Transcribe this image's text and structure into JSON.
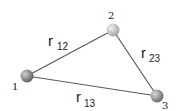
{
  "diagram": {
    "title": "",
    "nodes": [
      {
        "id": "1",
        "label": "1",
        "x": 27,
        "y": 76,
        "color": "#7a7a7a",
        "label_x": 12,
        "label_y": 89
      },
      {
        "id": "2",
        "label": "2",
        "x": 113,
        "y": 30,
        "color": "#b8b8b8",
        "label_x": 109,
        "label_y": 18
      },
      {
        "id": "3",
        "label": "3",
        "x": 157,
        "y": 96,
        "color": "#8a8a8a",
        "label_x": 162,
        "label_y": 109
      }
    ],
    "edges": [
      {
        "from": "1",
        "to": "2",
        "label": "r",
        "subscript": "12"
      },
      {
        "from": "2",
        "to": "3",
        "label": "r",
        "subscript": "23"
      },
      {
        "from": "1",
        "to": "3",
        "label": "r",
        "subscript": "13"
      }
    ],
    "edge_color": "#555555"
  }
}
